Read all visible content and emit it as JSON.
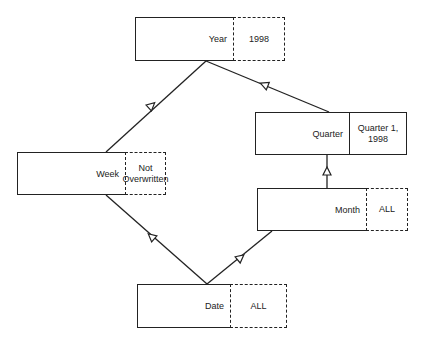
{
  "diagram": {
    "type": "hierarchy",
    "nodes": [
      {
        "id": "year",
        "label": "Year",
        "value": "1998",
        "value_border": "dashed"
      },
      {
        "id": "quarter",
        "label": "Quarter",
        "value": "Quarter 1, 1998",
        "value_border": "solid"
      },
      {
        "id": "week",
        "label": "Week",
        "value": "Not Overwritten",
        "value_border": "dashed"
      },
      {
        "id": "month",
        "label": "Month",
        "value": "ALL",
        "value_border": "dashed"
      },
      {
        "id": "date",
        "label": "Date",
        "value": "ALL",
        "value_border": "dashed"
      }
    ],
    "edges": [
      {
        "from": "week",
        "to": "year"
      },
      {
        "from": "quarter",
        "to": "year"
      },
      {
        "from": "month",
        "to": "quarter"
      },
      {
        "from": "date",
        "to": "week"
      },
      {
        "from": "date",
        "to": "month"
      }
    ]
  }
}
